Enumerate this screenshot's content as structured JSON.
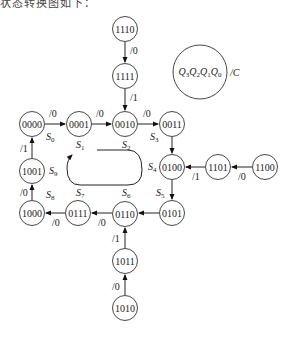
{
  "caption": "状态转换图如下：",
  "legend": {
    "label": "Q3Q2Q1Q0",
    "parts": [
      "Q",
      "3",
      "Q",
      "2",
      "Q",
      "1",
      "Q",
      "0"
    ],
    "output": "/C"
  },
  "states": [
    {
      "id": "s1110",
      "code": "1110",
      "x": 125,
      "y": 29
    },
    {
      "id": "s1111",
      "code": "1111",
      "x": 125,
      "y": 76
    },
    {
      "id": "s0000",
      "code": "0000",
      "x": 32,
      "y": 124,
      "name": "S0"
    },
    {
      "id": "s0001",
      "code": "0001",
      "x": 79,
      "y": 124,
      "name": "S1"
    },
    {
      "id": "s0010",
      "code": "0010",
      "x": 125,
      "y": 124,
      "name": "S2"
    },
    {
      "id": "s0011",
      "code": "0011",
      "x": 172,
      "y": 124,
      "name": "S3"
    },
    {
      "id": "s0100",
      "code": "0100",
      "x": 172,
      "y": 167,
      "name": "S4"
    },
    {
      "id": "s1101",
      "code": "1101",
      "x": 218,
      "y": 167
    },
    {
      "id": "s1100",
      "code": "1100",
      "x": 265,
      "y": 167
    },
    {
      "id": "s1001",
      "code": "1001",
      "x": 32,
      "y": 171,
      "name": "S9"
    },
    {
      "id": "s1000",
      "code": "1000",
      "x": 32,
      "y": 213,
      "name": "S8"
    },
    {
      "id": "s0111",
      "code": "0111",
      "x": 78,
      "y": 213,
      "name": "S7"
    },
    {
      "id": "s0110",
      "code": "0110",
      "x": 125,
      "y": 214,
      "name": "S6"
    },
    {
      "id": "s0101",
      "code": "0101",
      "x": 172,
      "y": 213,
      "name": "S5"
    },
    {
      "id": "s1011",
      "code": "1011",
      "x": 125,
      "y": 261
    },
    {
      "id": "s1010",
      "code": "1010",
      "x": 125,
      "y": 308
    }
  ],
  "transitions": [
    {
      "from": "1110",
      "to": "1111",
      "output": "/0"
    },
    {
      "from": "1111",
      "to": "0010",
      "output": "/1"
    },
    {
      "from": "0000",
      "to": "0001",
      "output": "/0"
    },
    {
      "from": "0001",
      "to": "0010",
      "output": "/0"
    },
    {
      "from": "0010",
      "to": "0011",
      "output": "/0"
    },
    {
      "from": "0011",
      "to": "0100",
      "output": ""
    },
    {
      "from": "1101",
      "to": "0100",
      "output": "/1"
    },
    {
      "from": "1100",
      "to": "1101",
      "output": "/0"
    },
    {
      "from": "0100",
      "to": "0101",
      "output": ""
    },
    {
      "from": "0101",
      "to": "0110",
      "output": "/0"
    },
    {
      "from": "0110",
      "to": "0111",
      "output": "/0"
    },
    {
      "from": "0111",
      "to": "1000",
      "output": "/0"
    },
    {
      "from": "1000",
      "to": "1001",
      "output": "/0"
    },
    {
      "from": "1001",
      "to": "0000",
      "output": "/1"
    },
    {
      "from": "1011",
      "to": "0110",
      "output": "/1"
    },
    {
      "from": "1010",
      "to": "1011",
      "output": "/0"
    }
  ],
  "state_names": [
    "S0",
    "S1",
    "S2",
    "S3",
    "S4",
    "S5",
    "S6",
    "S7",
    "S8",
    "S9"
  ]
}
